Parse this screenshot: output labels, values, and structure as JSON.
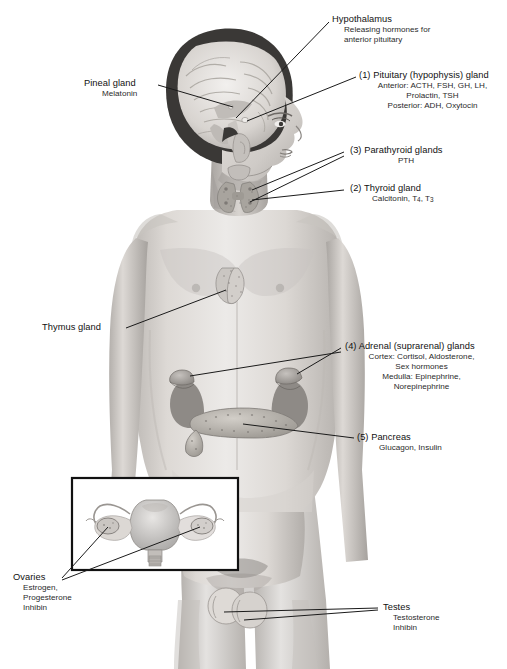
{
  "figure": {
    "inset_caption": "Female reproductive organs inset (uterus and ovaries)"
  },
  "colors": {
    "background": "#ffffff",
    "leader_line": "#1a1a1a",
    "label_text": "#111111",
    "sub_text": "#2a2a2a",
    "skin_light": "#e8e6e4",
    "skin_mid": "#cfcbc7",
    "skin_shadow": "#a9a5a1",
    "hair_dark": "#2e2c2b",
    "organ_gray": "#b9b5b1",
    "inset_border": "#111111"
  },
  "labels": {
    "hypothalamus": {
      "title": "Hypothalamus",
      "line1": "Releasing hormones for",
      "line2": "anterior pituitary"
    },
    "pituitary": {
      "title": "(1) Pituitary (hypophysis) gland",
      "line1": "Anterior: ACTH, FSH, GH, LH,",
      "line2": "Prolactin, TSH",
      "line3": "Posterior: ADH, Oxytocin"
    },
    "pineal": {
      "title": "Pineal gland",
      "line1": "Melatonin"
    },
    "parathyroid": {
      "title": "(3) Parathyroid glands",
      "line1": "PTH"
    },
    "thyroid": {
      "title": "(2) Thyroid gland",
      "line1_pre": "Calcitonin, T",
      "line1_sub1": "4",
      "line1_mid": ", T",
      "line1_sub2": "3"
    },
    "thymus": {
      "title": "Thymus gland"
    },
    "adrenal": {
      "title": "(4) Adrenal (suprarenal) glands",
      "line1": "Cortex: Cortisol, Aldosterone,",
      "line2": "Sex hormones",
      "line3": "Medulla: Epinephrine,",
      "line4": "Norepinephrine"
    },
    "pancreas": {
      "title": "(5) Pancreas",
      "line1": "Glucagon, Insulin"
    },
    "ovaries": {
      "title": "Ovaries",
      "line1": "Estrogen,",
      "line2": "Progesterone",
      "line3": "Inhibin"
    },
    "testes": {
      "title": "Testes",
      "line1": "Testosterone",
      "line2": "Inhibin"
    }
  }
}
